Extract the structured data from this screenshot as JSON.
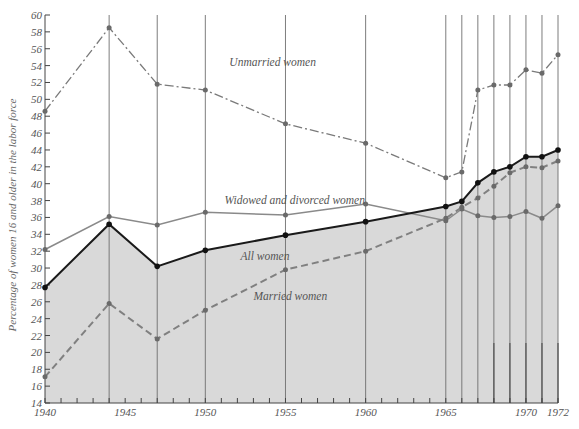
{
  "chart_data": {
    "type": "line",
    "title": "",
    "xlabel": "",
    "ylabel": "Percentage of women 16 and older in the labor force",
    "ylim": [
      14,
      60
    ],
    "xlim": [
      1940,
      1972
    ],
    "y_ticks": [
      14,
      16,
      18,
      20,
      22,
      24,
      26,
      28,
      30,
      32,
      34,
      36,
      38,
      40,
      42,
      44,
      46,
      48,
      50,
      52,
      54,
      56,
      58,
      60
    ],
    "x_tick_labels": [
      "1940",
      "1945",
      "1950",
      "1955",
      "1960",
      "1965",
      "1970",
      "1972"
    ],
    "x": [
      1940,
      1944,
      1947,
      1950,
      1955,
      1960,
      1965,
      1966,
      1967,
      1968,
      1969,
      1970,
      1971,
      1972
    ],
    "grid": false,
    "legend_position": "inline labels",
    "series": [
      {
        "name": "Unmarried women",
        "style": "dash-dot",
        "color": "#7a7a7a",
        "values": [
          48.6,
          58.5,
          51.8,
          51.1,
          47.1,
          44.8,
          40.7,
          41.4,
          51.1,
          51.7,
          51.7,
          53.5,
          53.1,
          55.3
        ]
      },
      {
        "name": "Widowed and divorced women",
        "style": "solid",
        "color": "#8a8a8a",
        "values": [
          32.2,
          36.1,
          35.1,
          36.6,
          36.3,
          37.6,
          35.6,
          37.0,
          36.2,
          36.0,
          36.1,
          36.7,
          35.9,
          37.4
        ]
      },
      {
        "name": "All women",
        "style": "solid-bold",
        "color": "#1a1a1a",
        "filled_below": true,
        "values": [
          27.7,
          35.2,
          30.2,
          32.1,
          33.9,
          35.5,
          37.3,
          37.9,
          40.1,
          41.4,
          42.0,
          43.2,
          43.2,
          44.0
        ]
      },
      {
        "name": "Married women",
        "style": "dashed",
        "color": "#808080",
        "values": [
          17.1,
          25.8,
          21.6,
          25.0,
          29.8,
          32.0,
          35.9,
          37.2,
          38.3,
          39.7,
          41.3,
          42.0,
          41.9,
          42.7
        ]
      }
    ],
    "annotations": [
      {
        "text": "Unmarried women",
        "x": 1951.5,
        "y": 54.0
      },
      {
        "text": "Widowed and divorced women",
        "x": 1951.2,
        "y": 37.6
      },
      {
        "text": "All women",
        "x": 1952.2,
        "y": 31.0
      },
      {
        "text": "Married women",
        "x": 1953.0,
        "y": 26.2
      }
    ],
    "vertical_lines_at": [
      1944,
      1947,
      1950,
      1955,
      1960,
      1965,
      1966,
      1967,
      1968,
      1969,
      1970,
      1971,
      1972
    ],
    "fill_color": "#d9d9d9"
  },
  "labels": {
    "ylabel": "Percentage of women 16 and older in the labor force",
    "unmarried": "Unmarried women",
    "widowed": "Widowed and divorced women",
    "all": "All women",
    "married": "Married women"
  }
}
